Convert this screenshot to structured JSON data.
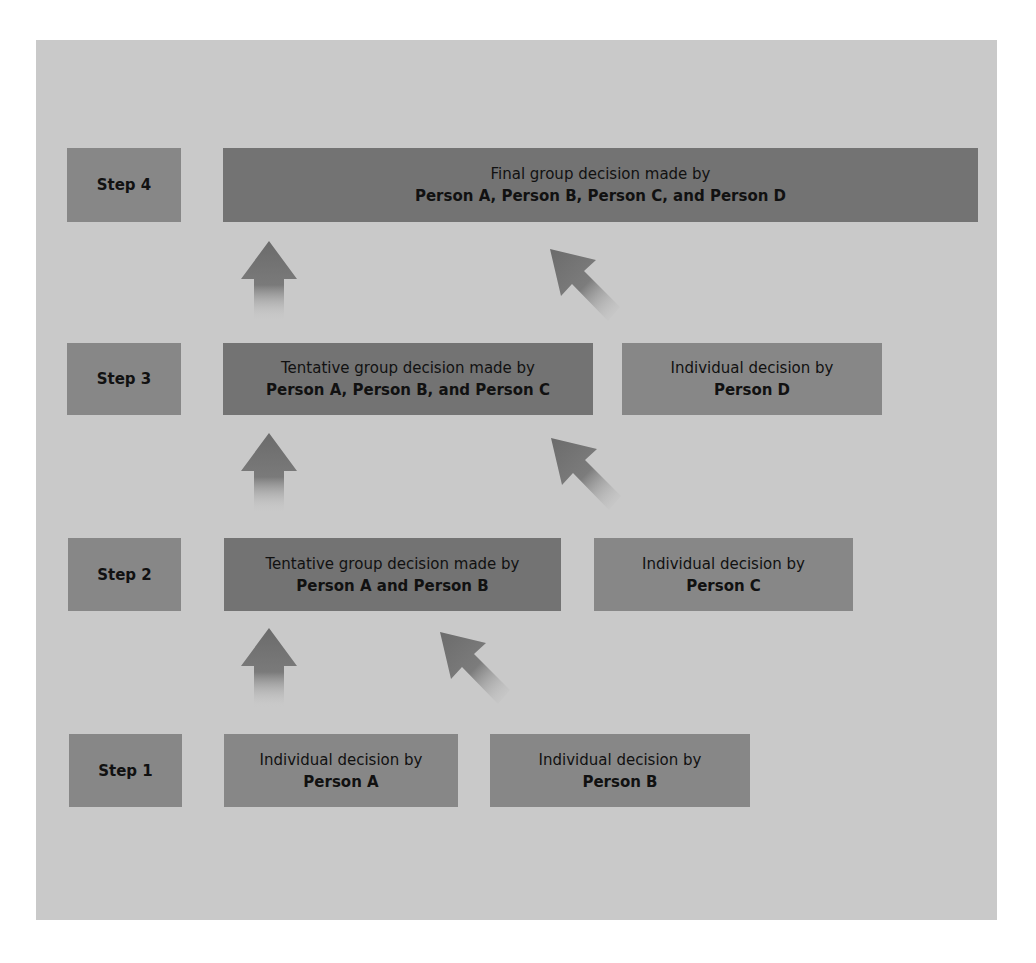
{
  "colors": {
    "page_background": "#ffffff",
    "panel_background": "#c9c9c9",
    "step_box": "#878787",
    "group_box": "#737373",
    "individual_box": "#878787",
    "arrow": "#6e6e6e"
  },
  "steps": [
    {
      "label": "Step 4",
      "boxes": [
        {
          "type": "group",
          "line1": "Final group decision made by",
          "line2": "Person A, Person B, Person C, and Person D"
        }
      ]
    },
    {
      "label": "Step 3",
      "boxes": [
        {
          "type": "group",
          "line1": "Tentative group decision made by",
          "line2": "Person A, Person B, and Person C"
        },
        {
          "type": "individual",
          "line1": "Individual decision by",
          "line2": "Person D"
        }
      ]
    },
    {
      "label": "Step 2",
      "boxes": [
        {
          "type": "group",
          "line1": "Tentative group decision made by",
          "line2": "Person A and Person B"
        },
        {
          "type": "individual",
          "line1": "Individual decision by",
          "line2": "Person C"
        }
      ]
    },
    {
      "label": "Step 1",
      "boxes": [
        {
          "type": "individual",
          "line1": "Individual decision by",
          "line2": "Person A"
        },
        {
          "type": "individual",
          "line1": "Individual decision by",
          "line2": "Person B"
        }
      ]
    }
  ],
  "arrows": [
    {
      "from": "Step 1 / Person A",
      "to": "Step 2 group",
      "direction": "up"
    },
    {
      "from": "Step 1 / Person B",
      "to": "Step 2 group",
      "direction": "up-left"
    },
    {
      "from": "Step 2 group",
      "to": "Step 3 group",
      "direction": "up"
    },
    {
      "from": "Step 2 / Person C",
      "to": "Step 3 group",
      "direction": "up-left"
    },
    {
      "from": "Step 3 group",
      "to": "Step 4 group",
      "direction": "up"
    },
    {
      "from": "Step 3 / Person D",
      "to": "Step 4 group",
      "direction": "up-left"
    }
  ]
}
